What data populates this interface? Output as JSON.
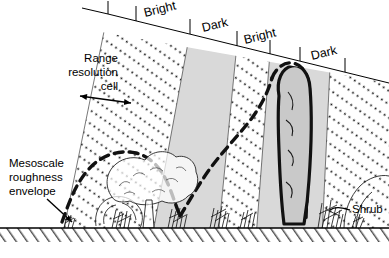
{
  "figure": {
    "width": 389,
    "height": 258,
    "background_color": "#ffffff",
    "ink_color": "#000000",
    "dark_band_fill": "#d9d9d9",
    "bright_band_fill": "#ffffff",
    "ground_line_color": "#000000"
  },
  "band_labels": [
    {
      "id": "band-bright-1",
      "text": "Bright",
      "x": 145,
      "y": 17,
      "rotate": -13.8
    },
    {
      "id": "band-dark-1",
      "text": "Dark",
      "x": 203,
      "y": 32,
      "rotate": -13.8
    },
    {
      "id": "band-bright-2",
      "text": "Bright",
      "x": 245,
      "y": 44,
      "rotate": -13.8
    },
    {
      "id": "band-dark-2",
      "text": "Dark",
      "x": 312,
      "y": 60,
      "rotate": -13.8
    }
  ],
  "annotations": {
    "range_cell": {
      "id": "range-resolution-cell-label",
      "lines": [
        "Range",
        "resolution",
        "cell"
      ],
      "anchor": "end",
      "x": 118,
      "y": 62
    },
    "mesoscale": {
      "id": "mesoscale-roughness-envelope-label",
      "lines": [
        "Mesoscale",
        "roughness",
        "envelope"
      ],
      "anchor": "start",
      "x": 9,
      "y": 167
    },
    "shrub": {
      "id": "shrub-label",
      "text": "Shrub",
      "anchor": "start",
      "x": 352,
      "y": 213
    }
  },
  "geometry": {
    "top_line": {
      "x1": 108,
      "y1": 14,
      "x2": 389,
      "y2": 83
    },
    "ground_line": {
      "x1": 0,
      "y1": 228,
      "x2": 389,
      "y2": 228
    },
    "band_boundaries_top_x": [
      108,
      135,
      190,
      237,
      270,
      300
    ],
    "range_cell_arrow": {
      "x1": 60,
      "y1": 95,
      "x2": 132,
      "y2": 103
    }
  }
}
